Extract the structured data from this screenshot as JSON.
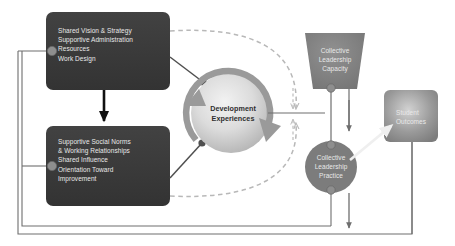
{
  "diagram": {
    "nodes": {
      "conditions_box": {
        "name": "organizational-conditions",
        "lines": [
          "Shared Vision & Strategy",
          "Supportive Administration",
          "Resources",
          "Work Design"
        ],
        "text": "Shared Vision & Strategy\nSupportive Administration\nResources\nWork Design",
        "shape": "rounded-rect",
        "fill": "#3a3a3a"
      },
      "norms_box": {
        "name": "social-norms",
        "lines": [
          "Supportive Social Norms",
          "& Working Relationships",
          "Shared Influence",
          "Orientation Toward",
          "Improvement"
        ],
        "text": "Supportive Social Norms\n  & Working Relationships\nShared Influence\nOrientation Toward\n      Improvement",
        "shape": "rounded-rect",
        "fill": "#3a3a3a"
      },
      "development": {
        "name": "development-experiences",
        "text": "Development\nExperiences",
        "shape": "sphere",
        "fill": "#c9c9c9"
      },
      "capacity": {
        "name": "collective-leadership-capacity",
        "text": "Collective\nLeadership\nCapacity",
        "shape": "trapezoid",
        "fill": "#7c7c7c"
      },
      "practice": {
        "name": "collective-leadership-practice",
        "text": "Collective\nLeadership\nPractice",
        "shape": "circle",
        "fill": "#7c7c7c"
      },
      "outcomes": {
        "name": "student-outcomes",
        "text": "Student\nOutcomes",
        "shape": "rounded-rect",
        "fill": "#8a8a8a"
      }
    },
    "colors": {
      "dark_box": "#3a3a3a",
      "mid_gray": "#7c7c7c",
      "light_gray": "#c9c9c9",
      "connector": "#5a5a5a",
      "dashed": "#b0b0b0",
      "feedback_line": "#6e6e6e",
      "arrow_black": "#111111",
      "text_light": "#e9e9e9",
      "text_dark": "#2e2e2e"
    }
  }
}
